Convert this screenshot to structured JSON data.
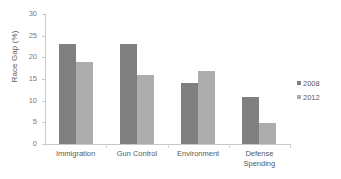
{
  "chart_data": {
    "type": "bar",
    "title": "",
    "subtitle": "",
    "xlabel": "",
    "ylabel": "Race Gap (%)",
    "categories": [
      "Immigration",
      "Gun Control",
      "Environment",
      "Defense Spending"
    ],
    "series": [
      {
        "name": "2008",
        "color": "#808080",
        "values": [
          23,
          23,
          14,
          10.8
        ]
      },
      {
        "name": "2012",
        "color": "#adadad",
        "values": [
          19,
          16,
          16.8,
          4.8
        ]
      }
    ],
    "ylim": [
      0,
      30
    ],
    "ytick_labels": [
      "0",
      "5",
      "10",
      "15",
      "20",
      "25",
      "30"
    ],
    "ytick_values": [
      0,
      5,
      10,
      15,
      20,
      25,
      30
    ],
    "grid": false,
    "legend_position": "right",
    "legend": [
      "2008",
      "2012"
    ],
    "background_color": "#ffffff",
    "axis_color": "#c9c9c9",
    "text_color": "#595959"
  }
}
